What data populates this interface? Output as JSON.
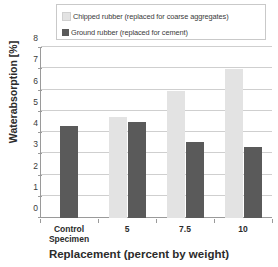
{
  "chart_data": {
    "type": "bar",
    "title": "",
    "xlabel": "Replacement (percent by weight)",
    "ylabel": "Waterabsorption [%]",
    "categories": [
      "Control Specimen",
      "5",
      "7.5",
      "10"
    ],
    "category_lines": [
      [
        "Control",
        "Specimen"
      ],
      [
        "5"
      ],
      [
        "7.5"
      ],
      [
        "10"
      ]
    ],
    "series": [
      {
        "name": "Chipped rubber (replaced for coarse aggregates)",
        "color": "#e3e3e3",
        "values": [
          null,
          4.75,
          6.0,
          7.0
        ]
      },
      {
        "name": "Ground rubber (replaced for cement)",
        "color": "#5a5a5a",
        "values": [
          4.35,
          4.5,
          3.6,
          3.35
        ]
      }
    ],
    "ylim": [
      0,
      8
    ],
    "yticks": [
      0,
      1,
      2,
      3,
      4,
      5,
      6,
      7,
      8
    ],
    "ytick_labels": [
      "0",
      "1",
      "2",
      "3",
      "4",
      "5",
      "6",
      "7",
      "8"
    ],
    "grid": true,
    "legend_position": "top"
  },
  "legend": {
    "items": [
      {
        "label": "Chipped rubber (replaced for coarse aggregates)",
        "color": "#e3e3e3"
      },
      {
        "label": "Ground rubber (replaced for cement)",
        "color": "#5a5a5a"
      }
    ]
  },
  "colors": {
    "chipped_rubber": "#e3e3e3",
    "ground_rubber": "#5a5a5a",
    "gridline": "#cfcfcf",
    "axis": "#9a9a9a",
    "text": "#2b2b2b",
    "background": "#ffffff"
  }
}
